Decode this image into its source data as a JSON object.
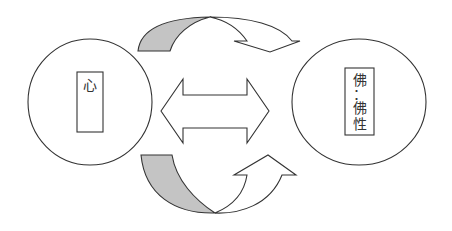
{
  "diagram": {
    "left_node": {
      "label": "心"
    },
    "right_node": {
      "lines": [
        "佛",
        "：",
        "佛",
        "性"
      ]
    },
    "arrows": {
      "top": "curved arrow from left to right (shaded tail)",
      "center": "double-headed arrow",
      "bottom": "curved arrow from left to right upward (shaded tail)"
    },
    "colors": {
      "stroke": "#333333",
      "shade": "#c4c4c4",
      "background": "#ffffff"
    }
  }
}
